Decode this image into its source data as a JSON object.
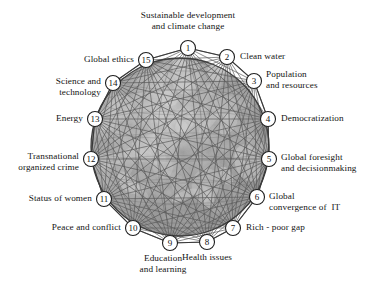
{
  "figure": {
    "kind": "radial-network-diagram",
    "background_color": "#ffffff",
    "globe": {
      "center_x": 180,
      "center_y": 147,
      "radius": 89,
      "fill_base_color": "#9b9b9b",
      "fill_light_color": "#d8d8d8",
      "outline_color": "#3f3f3f",
      "mesh_line_color": "#5a5a5a"
    },
    "node_style": {
      "radius": 7.5,
      "fill": "#ffffff",
      "stroke": "#1f1f1f"
    }
  },
  "nodes": [
    {
      "number": "1",
      "label": "Sustainable development\nand climate change",
      "angle_deg": -90,
      "cx": 188,
      "cy": 48,
      "label_x": 188,
      "label_y": 10,
      "align": "center"
    },
    {
      "number": "2",
      "label": "Clean water",
      "angle_deg": -66,
      "cx": 227,
      "cy": 57,
      "label_x": 240,
      "label_y": 51,
      "align": "left"
    },
    {
      "number": "3",
      "label": "Population\nand resources",
      "angle_deg": -42,
      "cx": 254,
      "cy": 81,
      "label_x": 266,
      "label_y": 69,
      "align": "left"
    },
    {
      "number": "4",
      "label": "Democratization",
      "angle_deg": -18,
      "cx": 268,
      "cy": 119,
      "label_x": 281,
      "label_y": 113,
      "align": "left"
    },
    {
      "number": "5",
      "label": "Global foresight\nand decisionmaking",
      "angle_deg": 6,
      "cx": 269,
      "cy": 159,
      "label_x": 281,
      "label_y": 152,
      "align": "left"
    },
    {
      "number": "6",
      "label": "Global\nconvergence of  IT",
      "angle_deg": 30,
      "cx": 257,
      "cy": 197,
      "label_x": 269,
      "label_y": 191,
      "align": "left"
    },
    {
      "number": "7",
      "label": "Rich - poor gap",
      "angle_deg": 54,
      "cx": 233,
      "cy": 228,
      "label_x": 246,
      "label_y": 222,
      "align": "left"
    },
    {
      "number": "8",
      "label": "Health issues",
      "angle_deg": 78,
      "cx": 207,
      "cy": 242,
      "label_x": 207,
      "label_y": 252,
      "align": "center"
    },
    {
      "number": "9",
      "label": "Education\nand learning",
      "angle_deg": 102,
      "cx": 170,
      "cy": 243,
      "label_x": 163,
      "label_y": 253,
      "align": "center"
    },
    {
      "number": "10",
      "label": "Peace and conflict",
      "angle_deg": 126,
      "cx": 133,
      "cy": 228,
      "label_x": 121,
      "label_y": 222,
      "align": "right"
    },
    {
      "number": "11",
      "label": "Status of women",
      "angle_deg": 150,
      "cx": 104,
      "cy": 199,
      "label_x": 92,
      "label_y": 193,
      "align": "right"
    },
    {
      "number": "12",
      "label": "Transnational\norganized crime",
      "angle_deg": 174,
      "cx": 91,
      "cy": 159,
      "label_x": 79,
      "label_y": 151,
      "align": "right"
    },
    {
      "number": "13",
      "label": "Energy",
      "angle_deg": 198,
      "cx": 95,
      "cy": 119,
      "label_x": 83,
      "label_y": 113,
      "align": "right"
    },
    {
      "number": "14",
      "label": "Science and\ntechnology",
      "angle_deg": 222,
      "cx": 113,
      "cy": 83,
      "label_x": 101,
      "label_y": 76,
      "align": "right"
    },
    {
      "number": "15",
      "label": "Global ethics",
      "angle_deg": 246,
      "cx": 146,
      "cy": 60,
      "label_x": 134,
      "label_y": 54,
      "align": "right"
    }
  ],
  "edges": [
    [
      0,
      2
    ],
    [
      0,
      3
    ],
    [
      0,
      4
    ],
    [
      0,
      5
    ],
    [
      0,
      6
    ],
    [
      0,
      7
    ],
    [
      0,
      8
    ],
    [
      0,
      9
    ],
    [
      0,
      10
    ],
    [
      0,
      11
    ],
    [
      0,
      12
    ],
    [
      0,
      13
    ],
    [
      1,
      3
    ],
    [
      1,
      4
    ],
    [
      1,
      5
    ],
    [
      1,
      6
    ],
    [
      1,
      7
    ],
    [
      1,
      8
    ],
    [
      1,
      9
    ],
    [
      1,
      10
    ],
    [
      1,
      11
    ],
    [
      1,
      12
    ],
    [
      1,
      13
    ],
    [
      1,
      14
    ],
    [
      2,
      4
    ],
    [
      2,
      5
    ],
    [
      2,
      6
    ],
    [
      2,
      7
    ],
    [
      2,
      8
    ],
    [
      2,
      9
    ],
    [
      2,
      10
    ],
    [
      2,
      11
    ],
    [
      2,
      12
    ],
    [
      2,
      13
    ],
    [
      2,
      14
    ],
    [
      3,
      5
    ],
    [
      3,
      6
    ],
    [
      3,
      7
    ],
    [
      3,
      8
    ],
    [
      3,
      9
    ],
    [
      3,
      10
    ],
    [
      3,
      11
    ],
    [
      3,
      12
    ],
    [
      3,
      13
    ],
    [
      3,
      14
    ],
    [
      4,
      6
    ],
    [
      4,
      7
    ],
    [
      4,
      8
    ],
    [
      4,
      9
    ],
    [
      4,
      10
    ],
    [
      4,
      11
    ],
    [
      4,
      12
    ],
    [
      4,
      13
    ],
    [
      4,
      14
    ],
    [
      5,
      7
    ],
    [
      5,
      8
    ],
    [
      5,
      9
    ],
    [
      5,
      10
    ],
    [
      5,
      11
    ],
    [
      5,
      12
    ],
    [
      5,
      13
    ],
    [
      5,
      14
    ],
    [
      6,
      8
    ],
    [
      6,
      9
    ],
    [
      6,
      10
    ],
    [
      6,
      11
    ],
    [
      6,
      12
    ],
    [
      6,
      13
    ],
    [
      6,
      14
    ],
    [
      7,
      9
    ],
    [
      7,
      10
    ],
    [
      7,
      11
    ],
    [
      7,
      12
    ],
    [
      7,
      13
    ],
    [
      7,
      14
    ],
    [
      8,
      10
    ],
    [
      8,
      11
    ],
    [
      8,
      12
    ],
    [
      8,
      13
    ],
    [
      8,
      14
    ],
    [
      9,
      11
    ],
    [
      9,
      12
    ],
    [
      9,
      13
    ],
    [
      9,
      14
    ],
    [
      10,
      12
    ],
    [
      10,
      13
    ],
    [
      10,
      14
    ],
    [
      11,
      13
    ],
    [
      11,
      14
    ],
    [
      12,
      14
    ],
    [
      13,
      0
    ],
    [
      14,
      1
    ],
    [
      0,
      1
    ],
    [
      1,
      2
    ],
    [
      2,
      3
    ],
    [
      3,
      4
    ],
    [
      4,
      5
    ],
    [
      5,
      6
    ],
    [
      6,
      7
    ],
    [
      7,
      8
    ],
    [
      8,
      9
    ],
    [
      9,
      10
    ],
    [
      10,
      11
    ],
    [
      11,
      12
    ],
    [
      12,
      13
    ],
    [
      13,
      14
    ],
    [
      14,
      0
    ]
  ]
}
